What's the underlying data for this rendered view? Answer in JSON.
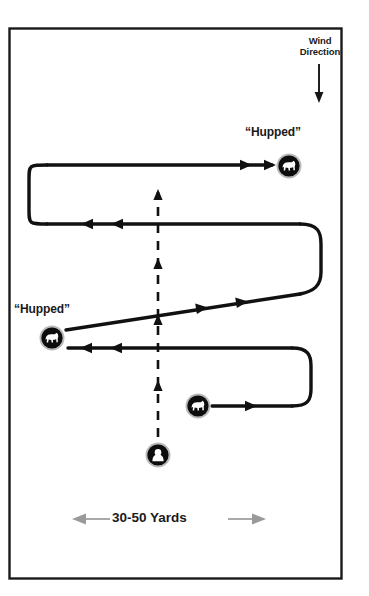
{
  "diagram": {
    "frame": {
      "x": 9,
      "y": 28,
      "width": 333,
      "height": 551,
      "border_color": "#1a1a1a"
    },
    "background": "#ffffff",
    "line_color": "#111111",
    "measure_arrow_color": "#9a9a9a"
  },
  "labels": {
    "wind_direction": "Wind\nDirection",
    "wind_direction_line1": "Wind",
    "wind_direction_line2": "Direction",
    "hupped_top": "“Hupped”",
    "hupped_left": "“Hupped”",
    "distance": "30-50 Yards"
  },
  "icons": {
    "dog_top": {
      "name": "dog-icon",
      "x": 289,
      "y": 166,
      "r": 13
    },
    "dog_left": {
      "name": "dog-icon",
      "x": 52,
      "y": 338,
      "r": 13
    },
    "dog_bottom": {
      "name": "dog-icon",
      "x": 198,
      "y": 406,
      "r": 13
    },
    "hunter": {
      "name": "hunter-icon",
      "x": 158,
      "y": 455,
      "r": 13
    }
  },
  "paths": {
    "dog_route_note": "serpentine quartering run",
    "handler_route_note": "dashed vertical walk line with up arrows"
  }
}
